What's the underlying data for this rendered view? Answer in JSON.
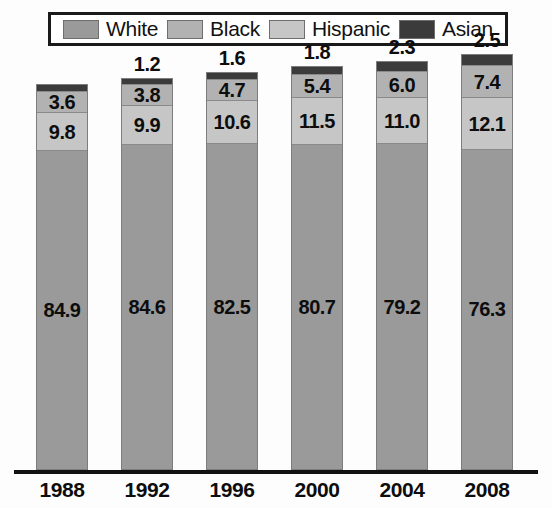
{
  "legend": {
    "items": [
      {
        "label": "White",
        "color": "#9a9a9a"
      },
      {
        "label": "Black",
        "color": "#b2b2b2"
      },
      {
        "label": "Hispanic",
        "color": "#c6c6c6"
      },
      {
        "label": "Asian",
        "color": "#3b3b3b"
      }
    ]
  },
  "chart_data": {
    "type": "bar",
    "subtype": "stacked-100-percent",
    "title": "",
    "subtitle": "",
    "xlabel": "",
    "ylabel": "",
    "ylim": [
      0,
      100
    ],
    "grid": false,
    "legend_position": "top",
    "stack_order_bottom_to_top": [
      "White",
      "Hispanic",
      "Black",
      "Asian"
    ],
    "categories": [
      "1988",
      "1992",
      "1996",
      "2000",
      "2004",
      "2008"
    ],
    "series": [
      {
        "name": "White",
        "color": "#9a9a9a",
        "values": [
          84.9,
          84.6,
          82.5,
          80.7,
          79.2,
          76.3
        ]
      },
      {
        "name": "Hispanic",
        "color": "#c6c6c6",
        "values": [
          9.8,
          9.9,
          10.6,
          11.5,
          11.0,
          12.1
        ]
      },
      {
        "name": "Black",
        "color": "#b2b2b2",
        "values": [
          3.6,
          3.8,
          4.7,
          5.4,
          6.0,
          7.4
        ]
      },
      {
        "name": "Asian",
        "color": "#3b3b3b",
        "values": [
          1.7,
          1.2,
          1.6,
          1.8,
          2.3,
          2.5
        ]
      }
    ],
    "bars": [
      {
        "category": "1988",
        "top_label": "",
        "segments": [
          {
            "name": "Asian",
            "value": 1.7,
            "label": "",
            "color": "#3b3b3b"
          },
          {
            "name": "Black",
            "value": 3.6,
            "label": "3.6",
            "color": "#b2b2b2"
          },
          {
            "name": "Hispanic",
            "value": 9.8,
            "label": "9.8",
            "color": "#c6c6c6"
          },
          {
            "name": "White",
            "value": 84.9,
            "label": "84.9",
            "color": "#9a9a9a"
          }
        ]
      },
      {
        "category": "1992",
        "top_label": "1.2",
        "segments": [
          {
            "name": "Asian",
            "value": 1.2,
            "label": "",
            "color": "#3b3b3b"
          },
          {
            "name": "Black",
            "value": 3.8,
            "label": "3.8",
            "color": "#b2b2b2"
          },
          {
            "name": "Hispanic",
            "value": 9.9,
            "label": "9.9",
            "color": "#c6c6c6"
          },
          {
            "name": "White",
            "value": 84.6,
            "label": "84.6",
            "color": "#9a9a9a"
          }
        ]
      },
      {
        "category": "1996",
        "top_label": "1.6",
        "segments": [
          {
            "name": "Asian",
            "value": 1.6,
            "label": "",
            "color": "#3b3b3b"
          },
          {
            "name": "Black",
            "value": 4.7,
            "label": "4.7",
            "color": "#b2b2b2"
          },
          {
            "name": "Hispanic",
            "value": 10.6,
            "label": "10.6",
            "color": "#c6c6c6"
          },
          {
            "name": "White",
            "value": 82.5,
            "label": "82.5",
            "color": "#9a9a9a"
          }
        ]
      },
      {
        "category": "2000",
        "top_label": "1.8",
        "segments": [
          {
            "name": "Asian",
            "value": 1.8,
            "label": "",
            "color": "#3b3b3b"
          },
          {
            "name": "Black",
            "value": 5.4,
            "label": "5.4",
            "color": "#b2b2b2"
          },
          {
            "name": "Hispanic",
            "value": 11.5,
            "label": "11.5",
            "color": "#c6c6c6"
          },
          {
            "name": "White",
            "value": 80.7,
            "label": "80.7",
            "color": "#9a9a9a"
          }
        ]
      },
      {
        "category": "2004",
        "top_label": "2.3",
        "segments": [
          {
            "name": "Asian",
            "value": 2.3,
            "label": "",
            "color": "#3b3b3b"
          },
          {
            "name": "Black",
            "value": 6.0,
            "label": "6.0",
            "color": "#b2b2b2"
          },
          {
            "name": "Hispanic",
            "value": 11.0,
            "label": "11.0",
            "color": "#c6c6c6"
          },
          {
            "name": "White",
            "value": 79.2,
            "label": "79.2",
            "color": "#9a9a9a"
          }
        ]
      },
      {
        "category": "2008",
        "top_label": "2.5",
        "segments": [
          {
            "name": "Asian",
            "value": 2.5,
            "label": "",
            "color": "#3b3b3b"
          },
          {
            "name": "Black",
            "value": 7.4,
            "label": "7.4",
            "color": "#b2b2b2"
          },
          {
            "name": "Hispanic",
            "value": 12.1,
            "label": "12.1",
            "color": "#c6c6c6"
          },
          {
            "name": "White",
            "value": 76.3,
            "label": "76.3",
            "color": "#9a9a9a"
          }
        ]
      }
    ]
  },
  "layout": {
    "bar_width_px": 52,
    "bar_left_positions_px": [
      36,
      121,
      206,
      291,
      376,
      461
    ],
    "bar_pixel_heights": [
      386,
      392,
      398,
      404,
      409,
      416
    ],
    "axis_baseline_color": "#111111"
  }
}
